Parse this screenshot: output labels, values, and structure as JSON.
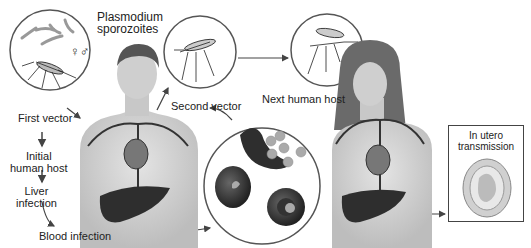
{
  "diagram": {
    "labels": {
      "sporozoites": [
        "Plasmodium",
        "sporozoites"
      ],
      "sex_symbols": "♀♂",
      "first_vector": "First vector",
      "initial_host": [
        "Initial",
        "human host"
      ],
      "liver": [
        "Liver",
        "infection"
      ],
      "blood": "Blood infection",
      "second_vector": "Second vector",
      "next_host": "Next human host",
      "in_utero": [
        "In utero",
        "transmission"
      ]
    },
    "nodes": [
      {
        "id": "sporozoite-vector",
        "label": "Plasmodium sporozoites / First vector"
      },
      {
        "id": "initial-host",
        "label": "Initial human host"
      },
      {
        "id": "liver",
        "label": "Liver infection"
      },
      {
        "id": "blood",
        "label": "Blood infection"
      },
      {
        "id": "second-vector",
        "label": "Second vector"
      },
      {
        "id": "next-host",
        "label": "Next human host"
      },
      {
        "id": "in-utero",
        "label": "In utero transmission"
      }
    ],
    "edges": [
      {
        "from": "sporozoite-vector",
        "to": "initial-host"
      },
      {
        "from": "initial-host",
        "to": "liver"
      },
      {
        "from": "liver",
        "to": "blood"
      },
      {
        "from": "blood",
        "to": "second-vector"
      },
      {
        "from": "second-vector",
        "to": "next-host"
      },
      {
        "from": "next-host",
        "to": "in-utero"
      }
    ],
    "colors": {
      "line": "#444444",
      "skin": "#d9d9d9",
      "vessel": "#3a3a3a",
      "organ": "#2e2e2e",
      "cell": "#3c3c3c"
    }
  }
}
